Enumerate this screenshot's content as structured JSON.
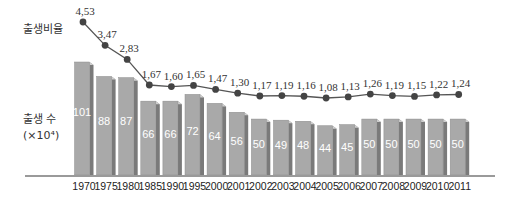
{
  "chart_data": {
    "type": "bar+line",
    "title": "",
    "categories": [
      "1970",
      "1975",
      "1980",
      "1985",
      "1990",
      "1995",
      "2000",
      "2001",
      "2002",
      "2003",
      "2004",
      "2005",
      "2006",
      "2007",
      "2008",
      "2009",
      "2010",
      "2011"
    ],
    "series": [
      {
        "name": "출생비율",
        "type": "line",
        "values": [
          4.53,
          3.47,
          2.83,
          1.67,
          1.6,
          1.65,
          1.47,
          1.3,
          1.17,
          1.19,
          1.16,
          1.08,
          1.13,
          1.26,
          1.19,
          1.15,
          1.22,
          1.24
        ]
      },
      {
        "name": "출생 수 (×10⁴)",
        "type": "bar",
        "values": [
          101,
          88,
          87,
          66,
          66,
          72,
          64,
          56,
          50,
          49,
          48,
          44,
          45,
          50,
          50,
          50,
          50,
          50
        ]
      }
    ],
    "line_labels": [
      "4,53",
      "3,47",
      "2,83",
      "1,67",
      "1,60",
      "1,65",
      "1,47",
      "1,30",
      "1,17",
      "1,19",
      "1,16",
      "1,08",
      "1,13",
      "1,26",
      "1,19",
      "1,15",
      "1,22",
      "1,24"
    ],
    "xlabel": "",
    "ylabel_line": "출생비율",
    "ylabel_bar": "출생 수",
    "ylabel_bar_unit": "(×10⁴)",
    "grid": false,
    "legend": "none"
  },
  "labels": {
    "line_axis": "출생비율",
    "bar_axis": "출생 수",
    "bar_unit": "(×10⁴)"
  },
  "colors": {
    "bar_front": "#a9a9a9",
    "bar_side": "#7a7a7a",
    "bar_top": "#d0d0d0",
    "line": "#555555",
    "marker": "#444444",
    "baseline": "#9a9a9a"
  }
}
